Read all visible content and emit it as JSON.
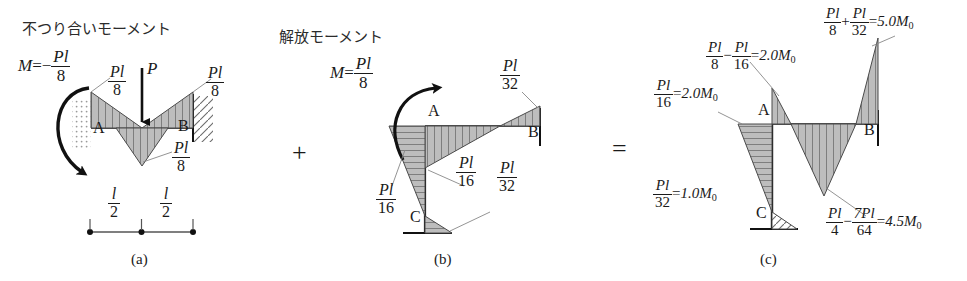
{
  "figure": {
    "width": 967,
    "height": 281,
    "ink_color": "#1a1a1a",
    "fill_color": "#b3b3b3",
    "type": "structural-bending-moment-diagram"
  },
  "operators": {
    "plus": "+",
    "equals": "="
  },
  "panel_a": {
    "caption": "(a)",
    "heading_jp": "不つり合いモーメント",
    "moment_equation": {
      "lhs": "M",
      "eq": "=",
      "sign": "−",
      "num": "Pl",
      "den": "8"
    },
    "node_a": "A",
    "node_b": "B",
    "load_label": "P",
    "labels": [
      {
        "name": "left-support-moment",
        "num": "Pl",
        "den": "8"
      },
      {
        "name": "right-support-moment",
        "num": "Pl",
        "den": "8"
      },
      {
        "name": "midspan-moment",
        "num": "Pl",
        "den": "8"
      }
    ],
    "dimensions": [
      {
        "name": "left-half-span",
        "num": "l",
        "den": "2"
      },
      {
        "name": "right-half-span",
        "num": "l",
        "den": "2"
      }
    ]
  },
  "panel_b": {
    "caption": "(b)",
    "heading_jp": "解放モーメント",
    "moment_equation": {
      "lhs": "M",
      "eq": "=",
      "num": "Pl",
      "den": "8"
    },
    "node_a": "A",
    "node_b": "B",
    "node_c": "C",
    "labels": [
      {
        "name": "beam-far-end-moment",
        "num": "Pl",
        "den": "32"
      },
      {
        "name": "joint-column-moment",
        "num": "Pl",
        "den": "16"
      },
      {
        "name": "joint-beam-moment",
        "num": "Pl",
        "den": "16"
      },
      {
        "name": "column-base-moment",
        "num": "Pl",
        "den": "32"
      }
    ]
  },
  "panel_c": {
    "caption": "(c)",
    "node_a": "A",
    "node_b": "B",
    "node_c": "C",
    "labels": [
      {
        "name": "column-top-moment",
        "terms": [
          {
            "num": "Pl",
            "den": "16"
          }
        ],
        "eq": "=",
        "result": "2.0M",
        "result_sub": "0"
      },
      {
        "name": "joint-beam-moment",
        "terms": [
          {
            "num": "Pl",
            "den": "8"
          },
          {
            "op": "−",
            "num": "Pl",
            "den": "16"
          }
        ],
        "eq": "=",
        "result": "2.0M",
        "result_sub": "0"
      },
      {
        "name": "far-end-support-moment",
        "terms": [
          {
            "num": "Pl",
            "den": "8"
          },
          {
            "op": "+",
            "num": "Pl",
            "den": "32"
          }
        ],
        "eq": "=",
        "result": "5.0M",
        "result_sub": "0"
      },
      {
        "name": "column-base-moment",
        "terms": [
          {
            "num": "Pl",
            "den": "32"
          }
        ],
        "eq": "=",
        "result": "1.0M",
        "result_sub": "0"
      },
      {
        "name": "midspan-moment",
        "terms": [
          {
            "num": "Pl",
            "den": "4"
          },
          {
            "op": "−",
            "num": "7Pl",
            "den": "64"
          }
        ],
        "eq": "=",
        "result": "4.5M",
        "result_sub": "0"
      }
    ]
  }
}
